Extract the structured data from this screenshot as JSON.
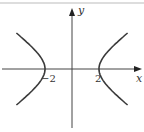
{
  "figure": {
    "type": "hyperbola-graph",
    "equation_form": "x^2/a^2 - y^2/b^2 = 1",
    "vertices": [
      -2,
      2
    ],
    "a": 2,
    "b": 2,
    "x_range": [
      -5,
      5
    ],
    "y_range": [
      -5,
      5
    ],
    "axis_labels": {
      "x": "x",
      "y": "y"
    },
    "tick_labels": {
      "left_vertex": "−2",
      "right_vertex": "2"
    },
    "colors": {
      "curve": "#3a3a3a",
      "axis": "#444444",
      "top_rule": "#bbbbbb"
    }
  }
}
